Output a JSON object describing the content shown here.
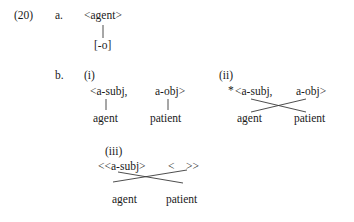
{
  "example": {
    "number": "(20)",
    "item_a_label": "a.",
    "item_b_label": "b."
  },
  "part_a": {
    "top": "<agent>",
    "bottom": "[-o]"
  },
  "part_b": {
    "subitems": [
      {
        "label": "(i)",
        "grammaticality": "",
        "top_left": "<a-subj,",
        "top_right": "a-obj>",
        "bottom_left": "agent",
        "bottom_right": "patient",
        "mapping": "parallel"
      },
      {
        "label": "(ii)",
        "grammaticality": "*",
        "top_left": "<a-subj,",
        "top_right": "a-obj>",
        "bottom_left": "agent",
        "bottom_right": "patient",
        "mapping": "crossed"
      },
      {
        "label": "(iii)",
        "grammaticality": "",
        "top_left": "<<a-subj>",
        "top_right": "<    >>",
        "bottom_left": "agent",
        "bottom_right": "patient",
        "mapping": "crossed"
      }
    ]
  },
  "style": {
    "ink": "#1a1a1a",
    "line": "#3a3a3a",
    "background": "#ffffff"
  }
}
